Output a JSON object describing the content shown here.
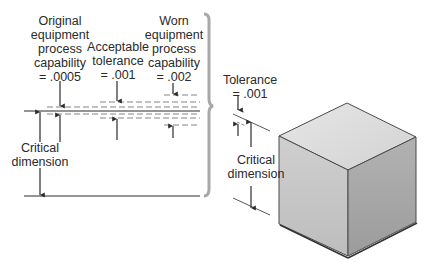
{
  "labels": {
    "original": {
      "lines": [
        "Original",
        "equipment",
        "process",
        "capability",
        "= .0005"
      ]
    },
    "acceptable": {
      "lines": [
        "Acceptable",
        "tolerance",
        "= .001"
      ]
    },
    "worn": {
      "lines": [
        "Worn",
        "equipment",
        "process",
        "capability",
        "= .002"
      ]
    },
    "critical_left": {
      "lines": [
        "Critical",
        "dimension"
      ]
    },
    "tolerance_right": {
      "lines": [
        "Tolerance",
        "= .001"
      ]
    },
    "critical_right": {
      "lines": [
        "Critical",
        "dimension"
      ]
    }
  },
  "colors": {
    "line": "#2a2a2a",
    "dash": "#555555",
    "brace": "#a8a8a8",
    "cube_top": "#dedede",
    "cube_left": "#c4c4c4",
    "cube_right": "#a9a9a9",
    "cube_edge": "#4a4a4a"
  }
}
